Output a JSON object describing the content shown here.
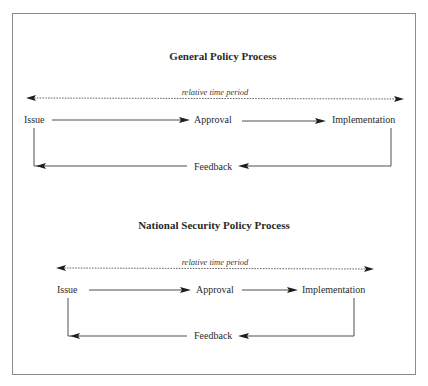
{
  "diagrams": [
    {
      "title": "General Policy Process",
      "time_label": "relative time period",
      "nodes": {
        "issue": "Issue",
        "approval": "Approval",
        "implementation": "Implementation",
        "feedback": "Feedback"
      }
    },
    {
      "title": "National Security Policy Process",
      "time_label": "relative time period",
      "nodes": {
        "issue": "Issue",
        "approval": "Approval",
        "implementation": "Implementation",
        "feedback": "Feedback"
      }
    }
  ],
  "colors": {
    "frame": "#8a8a8a",
    "text": "#2a2a2a",
    "arrow": "#1e1e1e"
  }
}
